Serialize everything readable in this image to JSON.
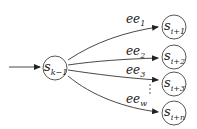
{
  "diagram": {
    "type": "state-transition",
    "source": {
      "id": "s_k-1",
      "base": "s",
      "sub": "k−1"
    },
    "targets": [
      {
        "id": "s_i+1",
        "base": "s",
        "sub": "i+1"
      },
      {
        "id": "s_i+2",
        "base": "s",
        "sub": "i+2"
      },
      {
        "id": "s_i+3",
        "base": "s",
        "sub": "i+3"
      },
      {
        "id": "s_i+n",
        "base": "s",
        "sub": "i+n"
      }
    ],
    "edges": [
      {
        "from": "s_k-1",
        "to": "s_i+1",
        "base": "ee",
        "sub": "1"
      },
      {
        "from": "s_k-1",
        "to": "s_i+2",
        "base": "ee",
        "sub": "2"
      },
      {
        "from": "s_k-1",
        "to": "s_i+3",
        "base": "ee",
        "sub": "3"
      },
      {
        "from": "s_k-1",
        "to": "s_i+n",
        "base": "ee",
        "sub": "w"
      }
    ],
    "ellipsis": "⋮",
    "incoming_arrow": true
  }
}
